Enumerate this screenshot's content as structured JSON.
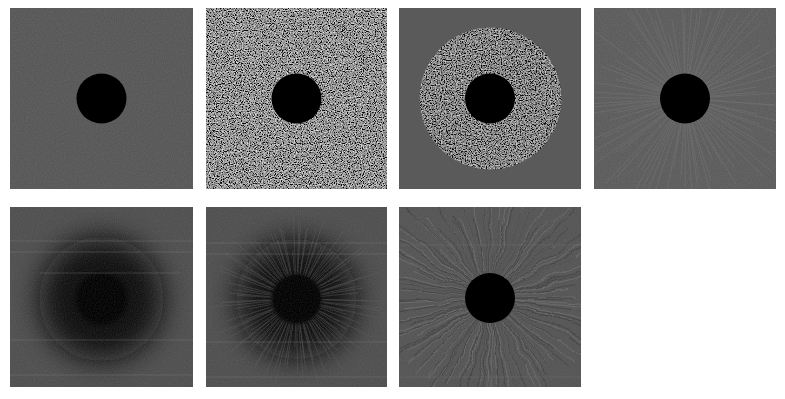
{
  "figure": {
    "background": "#ffffff",
    "panel_base_color": "#565656",
    "occluder_color": "#000000",
    "rows": 2,
    "columns": 4,
    "panels": [
      {
        "id": "p1",
        "row": 1,
        "col": 1,
        "label": "uniform background with central dark disk",
        "texture": "flat-fine-grain",
        "x": 10,
        "y": 8
      },
      {
        "id": "p2",
        "row": 1,
        "col": 2,
        "label": "full-field random noise with central dark disk",
        "texture": "strong-noise",
        "x": 206,
        "y": 8
      },
      {
        "id": "p3",
        "row": 1,
        "col": 3,
        "label": "circular noise annulus around central dark disk",
        "texture": "annulus-noise",
        "x": 399,
        "y": 8
      },
      {
        "id": "p4",
        "row": 1,
        "col": 4,
        "label": "faint radial streaks around central dark disk",
        "texture": "radial-faint",
        "x": 594,
        "y": 8
      },
      {
        "id": "p5",
        "row": 2,
        "col": 1,
        "label": "blurred dark halo with horizontal line artifacts",
        "texture": "dark-halo",
        "x": 10,
        "y": 207
      },
      {
        "id": "p6",
        "row": 2,
        "col": 2,
        "label": "dark halo with radial streaks and line artifacts",
        "texture": "dark-halo-radial",
        "x": 206,
        "y": 207
      },
      {
        "id": "p7",
        "row": 2,
        "col": 3,
        "label": "wavy radial filaments around central dark disk",
        "texture": "radial-filaments",
        "x": 399,
        "y": 207
      }
    ]
  }
}
